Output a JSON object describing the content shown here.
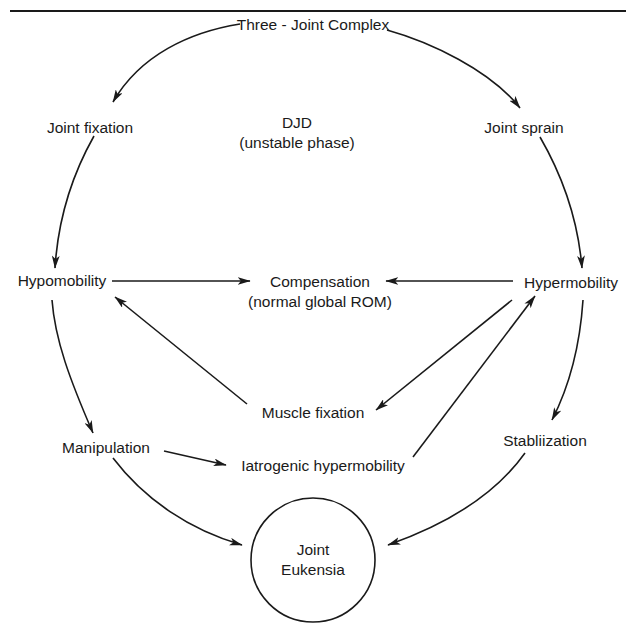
{
  "diagram": {
    "colors": {
      "ink": "#1a1a1a",
      "background": "#ffffff"
    },
    "nodes": {
      "three_joint_complex": "Three - Joint Complex",
      "joint_fixation": "Joint fixation",
      "joint_sprain": "Joint sprain",
      "djd": {
        "line1": "DJD",
        "line2": "(unstable phase)"
      },
      "hypomobility": "Hypomobility",
      "hypermobility": "Hypermobility",
      "compensation": {
        "line1": "Compensation",
        "line2": "(normal global ROM)"
      },
      "muscle_fixation": "Muscle fixation",
      "manipulation": "Manipulation",
      "iatrogenic_hypermobility": "Iatrogenic hypermobility",
      "stabilization": "Stabliization",
      "joint_eukensia": {
        "line1": "Joint",
        "line2": "Eukensia"
      }
    },
    "edges": [
      {
        "from": "Three - Joint Complex",
        "to": "Joint fixation"
      },
      {
        "from": "Three - Joint Complex",
        "to": "Joint sprain"
      },
      {
        "from": "Joint fixation",
        "to": "Hypomobility"
      },
      {
        "from": "Joint sprain",
        "to": "Hypermobility"
      },
      {
        "from": "Hypomobility",
        "to": "Compensation"
      },
      {
        "from": "Hypermobility",
        "to": "Compensation"
      },
      {
        "from": "Muscle fixation",
        "to": "Hypomobility"
      },
      {
        "from": "Hypermobility",
        "to": "Muscle fixation"
      },
      {
        "from": "Iatrogenic hypermobility",
        "to": "Hypermobility"
      },
      {
        "from": "Hypomobility",
        "to": "Manipulation"
      },
      {
        "from": "Hypermobility",
        "to": "Stabliization"
      },
      {
        "from": "Manipulation",
        "to": "Iatrogenic hypermobility"
      },
      {
        "from": "Manipulation",
        "to": "Joint Eukensia"
      },
      {
        "from": "Stabliization",
        "to": "Joint Eukensia"
      }
    ]
  }
}
